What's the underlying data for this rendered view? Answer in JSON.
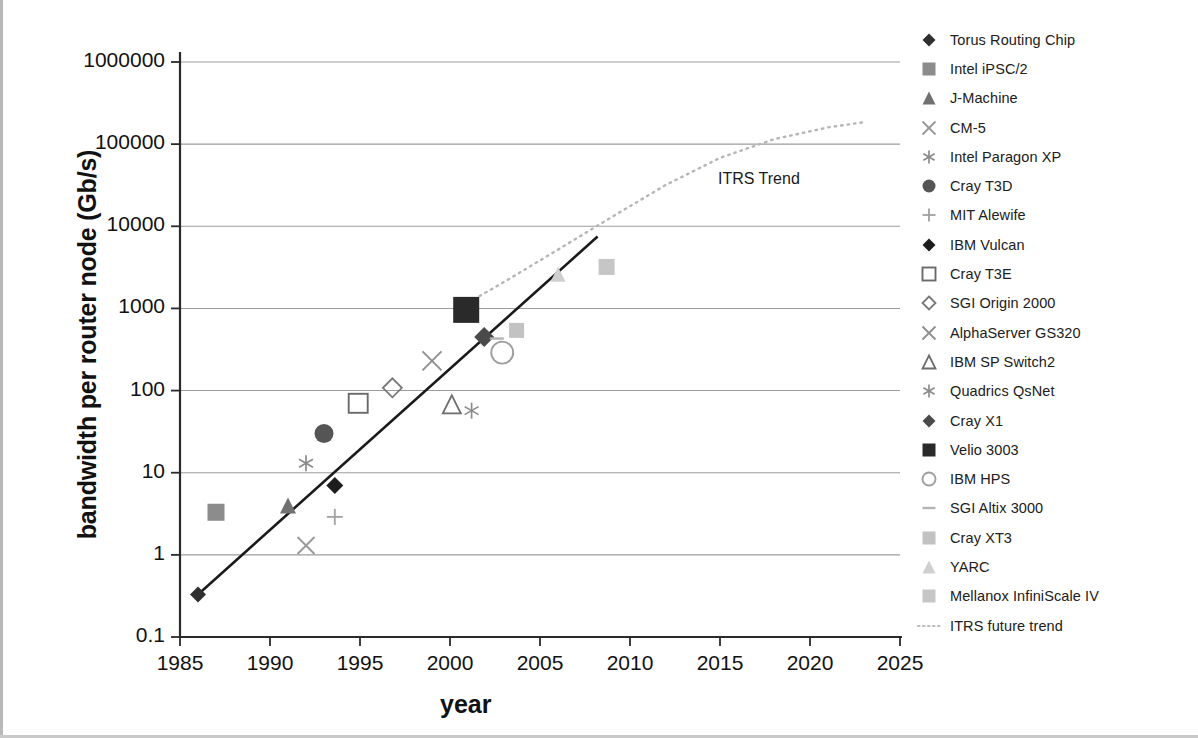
{
  "chart_data": {
    "type": "scatter",
    "title": "",
    "xlabel": "year",
    "ylabel": "bandwidth per router node (Gb/s)",
    "xlim": [
      1985,
      2025
    ],
    "ylim": [
      0.1,
      1000000
    ],
    "yscale": "log",
    "grid": "horizontal",
    "legend_position": "right",
    "xticks": [
      "1985",
      "1990",
      "1995",
      "2000",
      "2005",
      "2010",
      "2015",
      "2020",
      "2025"
    ],
    "yticks": [
      "0.1",
      "1",
      "10",
      "100",
      "1000",
      "10000",
      "100000",
      "1000000"
    ],
    "annotations": [
      {
        "text": "ITRS Trend",
        "x": 2011.5,
        "y": 14000
      }
    ],
    "series": [
      {
        "name": "Torus Routing Chip",
        "marker": "diamond-filled",
        "color": "#2f2f2f",
        "size": 16,
        "x": 1986.0,
        "y": 0.33
      },
      {
        "name": "Intel iPSC/2",
        "marker": "square-filled",
        "color": "#8c8c8c",
        "size": 17,
        "x": 1987.0,
        "y": 3.3
      },
      {
        "name": "J-Machine",
        "marker": "triangle-filled",
        "color": "#717171",
        "size": 16,
        "x": 1991.0,
        "y": 4.0
      },
      {
        "name": "CM-5",
        "marker": "cross-x",
        "color": "#9a9a9a",
        "size": 17,
        "x": 1992.0,
        "y": 1.3
      },
      {
        "name": "Intel Paragon XP",
        "marker": "asterisk",
        "color": "#8a8a8a",
        "size": 16,
        "x": 1992.0,
        "y": 13.0
      },
      {
        "name": "Cray T3D",
        "marker": "circle-filled",
        "color": "#555555",
        "size": 19,
        "x": 1993.0,
        "y": 30.0
      },
      {
        "name": "MIT Alewife",
        "marker": "plus",
        "color": "#a0a0a0",
        "size": 16,
        "x": 1993.6,
        "y": 2.9
      },
      {
        "name": "IBM Vulcan",
        "marker": "diamond-filled",
        "color": "#1d1d1d",
        "size": 17,
        "x": 1993.6,
        "y": 7.0
      },
      {
        "name": "Cray T3E",
        "marker": "square-open",
        "color": "#6a6a6a",
        "size": 19,
        "x": 1994.9,
        "y": 70.0
      },
      {
        "name": "SGI Origin 2000",
        "marker": "diamond-open",
        "color": "#777777",
        "size": 19,
        "x": 1996.8,
        "y": 108.0
      },
      {
        "name": "AlphaServer GS320",
        "marker": "cross-x",
        "color": "#909090",
        "size": 19,
        "x": 1999.0,
        "y": 230.0
      },
      {
        "name": "IBM SP Switch2",
        "marker": "triangle-open",
        "color": "#6d6d6d",
        "size": 18,
        "x": 2000.1,
        "y": 68.0
      },
      {
        "name": "Quadrics QsNet",
        "marker": "asterisk",
        "color": "#8c8c8c",
        "size": 16,
        "x": 2001.2,
        "y": 57.0
      },
      {
        "name": "Cray X1",
        "marker": "diamond-filled",
        "color": "#4a4a4a",
        "size": 20,
        "x": 2001.9,
        "y": 450.0
      },
      {
        "name": "Velio 3003",
        "marker": "square-filled",
        "color": "#2a2a2a",
        "size": 26,
        "x": 2000.9,
        "y": 960.0
      },
      {
        "name": "IBM HPS",
        "marker": "circle-open",
        "color": "#9e9e9e",
        "size": 22,
        "x": 2002.9,
        "y": 290.0
      },
      {
        "name": "SGI Altix 3000",
        "marker": "dash",
        "color": "#b4b4b4",
        "size": 14,
        "x": 2002.6,
        "y": 430.0
      },
      {
        "name": "Cray XT3",
        "marker": "square-filled",
        "color": "#c2c2c2",
        "size": 15,
        "x": 2003.7,
        "y": 540.0
      },
      {
        "name": "YARC",
        "marker": "triangle-filled",
        "color": "#cfcfcf",
        "size": 15,
        "x": 2006.0,
        "y": 2600.0
      },
      {
        "name": "Mellanox InfiniScale IV",
        "marker": "square-filled",
        "color": "#c6c6c6",
        "size": 16,
        "x": 2008.7,
        "y": 3200.0
      },
      {
        "name": "ITRS future trend",
        "marker": "dotted-line",
        "color": "#bdbdbd",
        "size": 0,
        "x": null,
        "y": null
      }
    ],
    "trend_line": {
      "name": "historical trend",
      "style": "solid",
      "color": "#1a1a1a",
      "from": {
        "x": 1986.0,
        "y": 0.33
      },
      "to": {
        "x": 2008.2,
        "y": 7500.0
      }
    },
    "itrs_curve": {
      "name": "ITRS future trend",
      "style": "dotted",
      "color": "#b5b5b5",
      "points": [
        {
          "x": 2000.4,
          "y": 980
        },
        {
          "x": 2003.0,
          "y": 2100
        },
        {
          "x": 2006.0,
          "y": 5200
        },
        {
          "x": 2009.0,
          "y": 13000
        },
        {
          "x": 2012.0,
          "y": 32000
        },
        {
          "x": 2015.0,
          "y": 68000
        },
        {
          "x": 2018.0,
          "y": 115000
        },
        {
          "x": 2021.0,
          "y": 160000
        },
        {
          "x": 2023.0,
          "y": 185000
        }
      ]
    }
  },
  "legend": {
    "items": [
      {
        "label": "Torus Routing Chip"
      },
      {
        "label": "Intel iPSC/2"
      },
      {
        "label": "J-Machine"
      },
      {
        "label": "CM-5"
      },
      {
        "label": "Intel Paragon XP"
      },
      {
        "label": "Cray T3D"
      },
      {
        "label": "MIT Alewife"
      },
      {
        "label": "IBM Vulcan"
      },
      {
        "label": "Cray T3E"
      },
      {
        "label": "SGI Origin 2000"
      },
      {
        "label": "AlphaServer GS320"
      },
      {
        "label": "IBM SP Switch2"
      },
      {
        "label": "Quadrics QsNet"
      },
      {
        "label": "Cray X1"
      },
      {
        "label": "Velio 3003"
      },
      {
        "label": "IBM HPS"
      },
      {
        "label": "SGI Altix 3000"
      },
      {
        "label": "Cray XT3"
      },
      {
        "label": "YARC"
      },
      {
        "label": "Mellanox InfiniScale IV"
      },
      {
        "label": "ITRS future trend"
      }
    ]
  }
}
